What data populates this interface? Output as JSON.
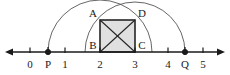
{
  "figure": {
    "background_color": "#ffffff",
    "stroke_color": "#1a1a1a",
    "arc_color": "#555555",
    "square_fill": "#e0e0e0",
    "width": 230,
    "height": 75
  },
  "number_line": {
    "axis_y": 52,
    "x_start": 5,
    "x_end": 225,
    "left_arrow": true,
    "right_arrow": true,
    "tick_labels": [
      "0",
      "1",
      "2",
      "3",
      "4",
      "5"
    ],
    "tick_values": [
      0,
      1,
      2,
      3,
      4,
      5
    ],
    "tick_x": [
      30,
      65,
      100,
      135,
      168,
      203
    ],
    "tick_label_y": 68
  },
  "marked_points": [
    {
      "label": "P",
      "x": 48,
      "y": 52,
      "label_x": 48,
      "label_y": 68,
      "filled": true
    },
    {
      "label": "Q",
      "x": 185,
      "y": 52,
      "label_x": 185,
      "label_y": 68,
      "filled": true
    }
  ],
  "square": {
    "name": "ABCD",
    "fill": "#e0e0e0",
    "left_x": 100,
    "right_x": 135,
    "top_y": 20,
    "bottom_y": 52,
    "side_length_units": 1,
    "diagonals": true,
    "vertices": [
      {
        "label": "A",
        "x": 100,
        "y": 20,
        "label_x": 93,
        "label_y": 17
      },
      {
        "label": "D",
        "x": 135,
        "y": 20,
        "label_x": 142,
        "label_y": 17
      },
      {
        "label": "B",
        "x": 100,
        "y": 52,
        "label_x": 93,
        "label_y": 49
      },
      {
        "label": "C",
        "x": 135,
        "y": 52,
        "label_x": 142,
        "label_y": 49
      }
    ]
  },
  "arcs": [
    {
      "name": "left-arc",
      "description": "semicircle centered at 2 through P and D",
      "center_x": 100,
      "center_y": 52,
      "radius": 52,
      "start_x": 48,
      "end_x": 152
    },
    {
      "name": "right-arc",
      "description": "semicircle centered at 3 through A and Q",
      "center_x": 135,
      "center_y": 52,
      "radius": 50,
      "start_x": 85,
      "end_x": 185
    }
  ]
}
